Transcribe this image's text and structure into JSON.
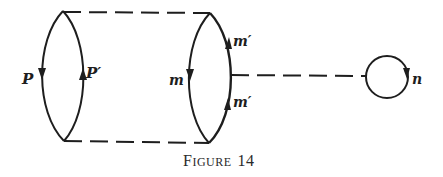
{
  "figure": {
    "caption_first": "F",
    "caption_rest": "IGURE",
    "caption_number": "14",
    "caption": "FIGURE 14"
  },
  "labels": {
    "left_loop_left": "P",
    "left_loop_right": "P′",
    "middle_loop_left": "m",
    "middle_loop_right_top": "m′",
    "middle_loop_right_bottom": "m′",
    "small_loop": "n"
  },
  "colors": {
    "ink": "#1e1e1e",
    "background": "#ffffff"
  }
}
